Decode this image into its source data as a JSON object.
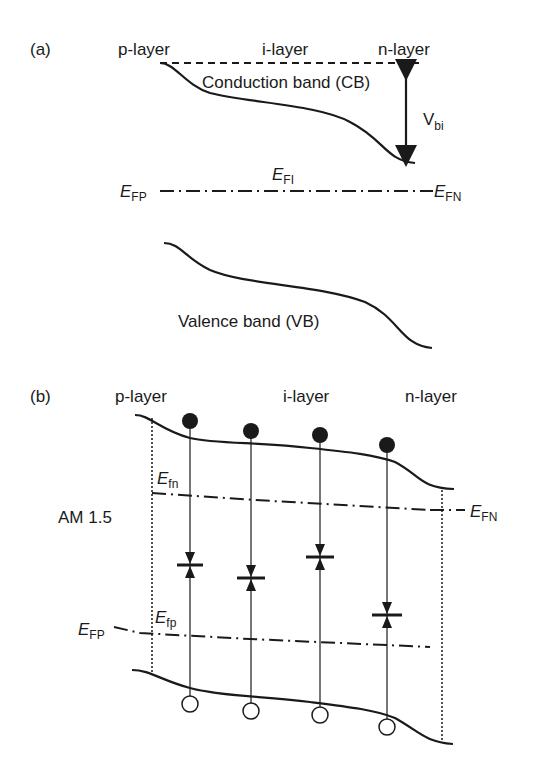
{
  "panel_a": {
    "label": "(a)",
    "layers": {
      "p": "p-layer",
      "i": "i-layer",
      "n": "n-layer"
    },
    "conduction_band": "Conduction band (CB)",
    "valence_band": "Valence band (VB)",
    "vbi": {
      "main": "V",
      "sub": "bi"
    },
    "efi": {
      "main": "E",
      "sub": "FI"
    },
    "efp": {
      "main": "E",
      "sub": "FP"
    },
    "efn": {
      "main": "E",
      "sub": "FN"
    }
  },
  "panel_b": {
    "label": "(b)",
    "layers": {
      "p": "p-layer",
      "i": "i-layer",
      "n": "n-layer"
    },
    "illumination": "AM 1.5",
    "efn_quasi": {
      "main": "E",
      "sub": "fn"
    },
    "efp_quasi": {
      "main": "E",
      "sub": "fp"
    },
    "efn": {
      "main": "E",
      "sub": "FN"
    },
    "efp": {
      "main": "E",
      "sub": "FP"
    }
  },
  "colors": {
    "ink": "#1a1a1a",
    "background": "#ffffff"
  }
}
